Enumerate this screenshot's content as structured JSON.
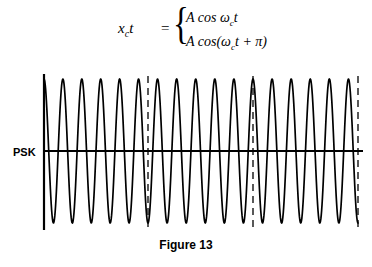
{
  "figure": {
    "caption": "Figure 13",
    "signal_label": "PSK",
    "equation": {
      "lhs": "x",
      "lhs_sub": "c",
      "lhs_tail": "t",
      "equals": "=",
      "brace": "{",
      "line1": "A cos ω",
      "line1_sub": "c",
      "line1_tail": "t",
      "line2_open": "A cos(ω",
      "line2_sub": "c",
      "line2_tail": "t + π)"
    }
  },
  "chart_data": {
    "type": "line",
    "title": "Figure 13",
    "series_name": "PSK",
    "amplitude": 1.0,
    "carrier_cycles_per_symbol": 5.5,
    "phase_values_deg": [
      0,
      180,
      0,
      180
    ],
    "symbol_boundaries_x": [
      148,
      253,
      358
    ],
    "axis_x_start": 44,
    "axis_y_baseline": 89,
    "colors": {
      "waveform": "#000000",
      "axis": "#000000",
      "boundary": "#000000",
      "background": "#ffffff"
    },
    "grid": false,
    "legend": "none"
  }
}
